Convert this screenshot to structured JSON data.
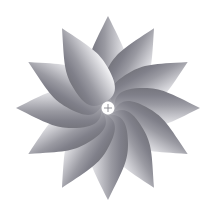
{
  "canvas": {
    "width": 216,
    "height": 215,
    "background_color": "#ffffff",
    "title": "Radial Petal Pattern"
  },
  "figure": {
    "name": "radial-petal-rosette",
    "petal_count": 12,
    "angle_step_degrees": 30,
    "center_x": 108,
    "center_y": 108,
    "inner_radius": 34,
    "outer_radius": 92,
    "petal_half_width": 20,
    "orientation": "petals point outward radially",
    "first_petal_angle_degrees": 0
  },
  "petal_style": {
    "gradient_dark_color": "#7e7e86",
    "gradient_mid_color": "#a0a0a6",
    "gradient_light_color": "#dcdce0",
    "gradient_edge_color": "#f2f2f4",
    "gradient_direction": "dark on counter-clockwise leading edge fading to light on clockwise trailing edge",
    "stroke": "none",
    "texture": "dithered halftone grayscale"
  },
  "center_marker": {
    "name": "center-cross-marker",
    "x": 108,
    "y": 108,
    "arm_length": 4,
    "color": "#7a7a80",
    "stroke_width": 0.8,
    "shape": "plus"
  },
  "petals": [
    {
      "index": 1,
      "angle_degrees": 0,
      "label": "petal-12-oclock"
    },
    {
      "index": 2,
      "angle_degrees": 30,
      "label": "petal-1-oclock"
    },
    {
      "index": 3,
      "angle_degrees": 60,
      "label": "petal-2-oclock"
    },
    {
      "index": 4,
      "angle_degrees": 90,
      "label": "petal-3-oclock"
    },
    {
      "index": 5,
      "angle_degrees": 120,
      "label": "petal-4-oclock"
    },
    {
      "index": 6,
      "angle_degrees": 150,
      "label": "petal-5-oclock"
    },
    {
      "index": 7,
      "angle_degrees": 180,
      "label": "petal-6-oclock"
    },
    {
      "index": 8,
      "angle_degrees": 210,
      "label": "petal-7-oclock"
    },
    {
      "index": 9,
      "angle_degrees": 240,
      "label": "petal-8-oclock"
    },
    {
      "index": 10,
      "angle_degrees": 270,
      "label": "petal-9-oclock"
    },
    {
      "index": 11,
      "angle_degrees": 300,
      "label": "petal-10-oclock"
    },
    {
      "index": 12,
      "angle_degrees": 330,
      "label": "petal-11-oclock"
    }
  ]
}
